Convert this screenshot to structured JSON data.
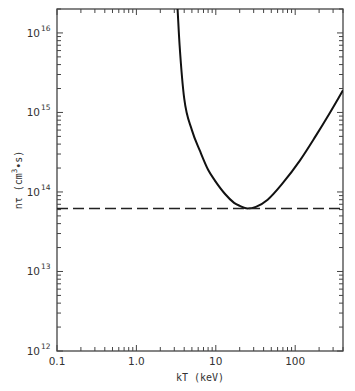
{
  "chart_data": {
    "type": "line",
    "title": "",
    "xlabel": "kT (keV)",
    "ylabel": "nτ (cm⁻³·s)",
    "ylabel_parts": {
      "main": "nτ  (cm",
      "exp": "3",
      "tail": "•s)"
    },
    "xscale": "log",
    "yscale": "log",
    "xlim": [
      0.1,
      400
    ],
    "ylim": [
      1000000000000.0,
      2e+16
    ],
    "grid": false,
    "x_ticks": [
      {
        "value": 0.1,
        "label": "0.1"
      },
      {
        "value": 1,
        "label": "1.0"
      },
      {
        "value": 10,
        "label": "10"
      },
      {
        "value": 100,
        "label": "100"
      }
    ],
    "y_ticks": [
      {
        "value": 1000000000000.0,
        "base": "10",
        "exp": "12"
      },
      {
        "value": 10000000000000.0,
        "base": "10",
        "exp": "13"
      },
      {
        "value": 100000000000000.0,
        "base": "10",
        "exp": "14"
      },
      {
        "value": 1000000000000000.0,
        "base": "10",
        "exp": "15"
      },
      {
        "value": 1e+16,
        "base": "10",
        "exp": "16"
      }
    ],
    "series": [
      {
        "name": "ignition curve",
        "style": "solid",
        "x": [
          3.3,
          3.5,
          4.0,
          5.0,
          6.3,
          8.0,
          9.7,
          13,
          17,
          20,
          25,
          32,
          45,
          70,
          115,
          180,
          275,
          400
        ],
        "y": [
          2e+16,
          7000000000000000.0,
          1500000000000000.0,
          600000000000000.0,
          330000000000000.0,
          190000000000000.0,
          140000000000000.0,
          95000000000000.0,
          73000000000000.0,
          67000000000000.0,
          62000000000000.0,
          65000000000000.0,
          80000000000000.0,
          130000000000000.0,
          250000000000000.0,
          500000000000000.0,
          1000000000000000.0,
          1900000000000000.0
        ]
      },
      {
        "name": "Lawson minimum",
        "style": "dashed",
        "x": [
          0.1,
          400
        ],
        "y": [
          62000000000000.0,
          62000000000000.0
        ]
      }
    ]
  }
}
